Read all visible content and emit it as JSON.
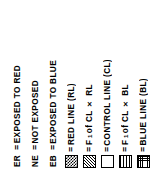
{
  "legend": {
    "orientation": "rotated-90-ccw",
    "text_color": "#000000",
    "background_color": "#ffffff",
    "separator": "=",
    "entries": [
      {
        "key_type": "text",
        "key": "ER",
        "swatch": "none",
        "equals": "=",
        "label": "EXPOSED TO RED"
      },
      {
        "key_type": "text",
        "key": "NE",
        "swatch": "none",
        "equals": "=",
        "label": "NOT EXPOSED"
      },
      {
        "key_type": "text",
        "key": "EB",
        "swatch": "none",
        "equals": "=",
        "label": "EXPOSED TO BLUE"
      },
      {
        "key_type": "swatch",
        "key": "",
        "swatch": "checkerboard",
        "equals": "=",
        "label": "RED LINE (RL)"
      },
      {
        "key_type": "swatch",
        "key": "",
        "swatch": "diagonal-hatch",
        "equals": "=",
        "label_prefix": "F",
        "label_sub": "1",
        "label_suffix": " of CL × RL",
        "label": "F1 of CL × RL"
      },
      {
        "key_type": "swatch",
        "key": "",
        "swatch": "blank-white",
        "equals": "=",
        "label": "CONTROL LINE (CL)"
      },
      {
        "key_type": "swatch",
        "key": "",
        "swatch": "vertical-lines",
        "equals": "=",
        "label_prefix": "F",
        "label_sub": "1",
        "label_suffix": " of CL × BL",
        "label": "F1 of CL × BL"
      },
      {
        "key_type": "swatch",
        "key": "",
        "swatch": "crosshatch-grid",
        "equals": "=",
        "label": "BLUE LINE (BL)"
      }
    ]
  }
}
